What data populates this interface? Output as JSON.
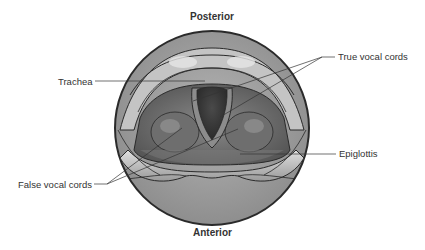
{
  "diagram": {
    "type": "anatomical-illustration",
    "orientation": {
      "top": "Posterior",
      "bottom": "Anterior"
    },
    "labels": [
      {
        "id": "trachea",
        "text": "Trachea",
        "side": "left"
      },
      {
        "id": "true-vocal-cords",
        "text": "True vocal cords",
        "side": "right"
      },
      {
        "id": "epiglottis",
        "text": "Epiglottis",
        "side": "right"
      },
      {
        "id": "false-vocal-cords",
        "text": "False vocal cords",
        "side": "left"
      }
    ],
    "colors": {
      "outline": "#2a2a2a",
      "outer_ring": "#9a9a9a",
      "tissue_light": "#bdbdbd",
      "tissue_mid": "#7d7d7d",
      "tissue_dark": "#555555",
      "airway": "#3a3a3a",
      "leader_line": "#333333",
      "text": "#333333"
    }
  }
}
